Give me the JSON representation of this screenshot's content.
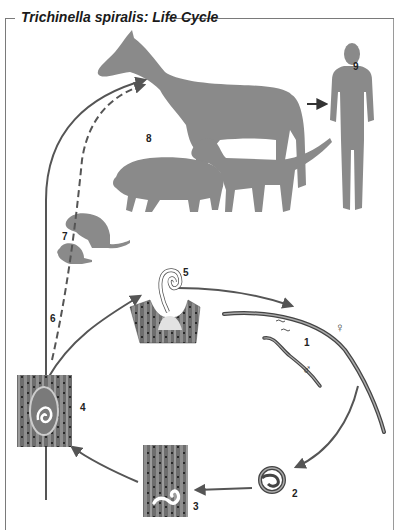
{
  "title": "Trichinella spiralis: Life Cycle",
  "colors": {
    "silhouette": "#8a8a8a",
    "arrow": "#555555",
    "muscle_dark": "#5a5a5a",
    "muscle_light": "#9a9a9a",
    "larva": "#ffffff",
    "frame": "#7a7a7a"
  },
  "stages": [
    {
      "number": "1",
      "label": "Adult worms (female and male) in intestine"
    },
    {
      "number": "2",
      "label": "Coiled larva"
    },
    {
      "number": "3",
      "label": "Larva entering muscle fiber"
    },
    {
      "number": "4",
      "label": "Encysted larva in muscle"
    },
    {
      "number": "5",
      "label": "Larva emerging in intestinal mucosa"
    },
    {
      "number": "6",
      "label": "Transmission path"
    },
    {
      "number": "7",
      "label": "Rodents"
    },
    {
      "number": "8",
      "label": "Horse, pig, dog"
    },
    {
      "number": "9",
      "label": "Human"
    }
  ],
  "symbols": {
    "female": "♀",
    "male": "♂"
  },
  "hosts": [
    "horse",
    "pig",
    "dog",
    "rat",
    "mouse",
    "human"
  ]
}
